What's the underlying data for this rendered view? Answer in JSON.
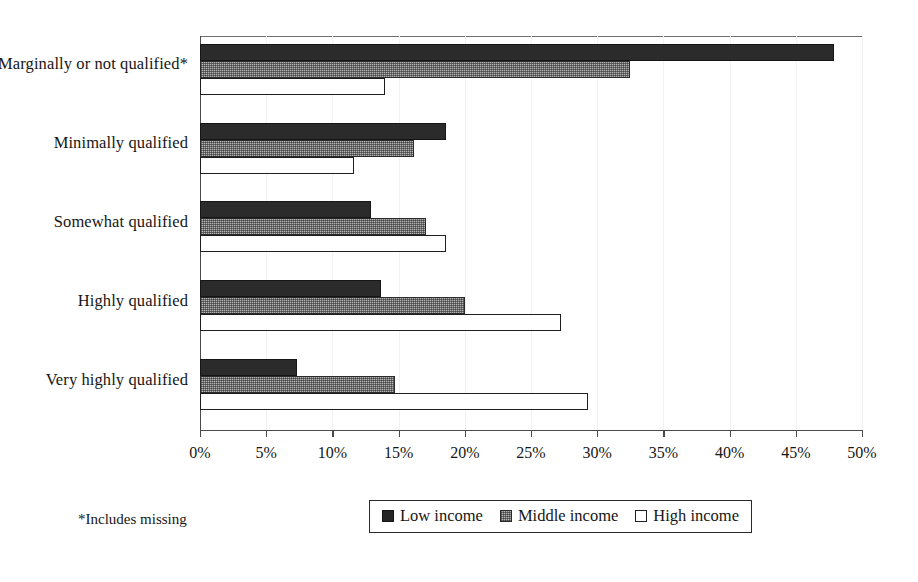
{
  "chart_data": {
    "type": "bar",
    "orientation": "horizontal",
    "title": "",
    "subtitle": "",
    "xlabel": "",
    "ylabel": "",
    "xlim": [
      0,
      50
    ],
    "xunit": "%",
    "grid": true,
    "grid_axis": "x",
    "legend_position": "bottom",
    "categories": [
      "Marginally  or not qualified*",
      "Minimally qualified",
      "Somewhat qualified",
      "Highly qualified",
      "Very highly qualified"
    ],
    "tick_labels": [
      "0%",
      "5%",
      "10%",
      "15%",
      "20%",
      "25%",
      "30%",
      "35%",
      "40%",
      "45%",
      "50%"
    ],
    "tick_values": [
      0,
      5,
      10,
      15,
      20,
      25,
      30,
      35,
      40,
      45,
      50
    ],
    "series": [
      {
        "name": "Low income",
        "color": "#2b2b2b",
        "fill": "solid-black",
        "values": [
          47.9,
          18.6,
          12.9,
          13.7,
          7.3
        ]
      },
      {
        "name": "Middle income",
        "color": "#b4b4b4",
        "fill": "dithered-gray",
        "values": [
          32.5,
          16.2,
          17.1,
          20.0,
          14.7
        ]
      },
      {
        "name": "High income",
        "color": "#ffffff",
        "fill": "white-outline",
        "values": [
          14.0,
          11.6,
          18.6,
          27.3,
          29.3
        ]
      }
    ],
    "annotations": [
      {
        "name": "footnote",
        "text": "*Includes missing"
      }
    ]
  },
  "legend": {
    "items": [
      {
        "label": "Low income",
        "swatch": "swatch-low-icon"
      },
      {
        "label": "Middle income",
        "swatch": "swatch-middle-icon"
      },
      {
        "label": "High income",
        "swatch": "swatch-high-icon"
      }
    ]
  },
  "footnote": {
    "text": "*Includes missing"
  }
}
